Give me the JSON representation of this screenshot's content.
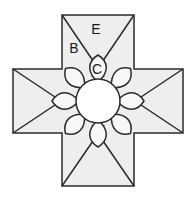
{
  "figure": {
    "name": "cross-rosette-diagram",
    "colors": {
      "arm_fill": "#eeeeee",
      "center_fill": "#ffffff",
      "petal_fill": "#f7f7f7",
      "stroke": "#2b2b2b",
      "background": "#ffffff",
      "label": "#1a1a1a"
    },
    "geometry": {
      "cross_left": 13,
      "cross_right": 183,
      "cross_top": 15,
      "cross_bottom": 186,
      "arm_inner_left": 62,
      "arm_inner_right": 134,
      "arm_inner_top": 69,
      "arm_inner_bottom": 133,
      "center_x": 98,
      "center_y": 101,
      "center_radius": 22,
      "petal_count": 8,
      "petal_inner_radius": 22,
      "petal_outer_radius": 46,
      "petal_half_width": 11,
      "stroke_width": 1.5
    }
  },
  "labels": [
    {
      "id": "label-b",
      "text": "B",
      "x": 74,
      "y": 49
    },
    {
      "id": "label-e",
      "text": "E",
      "x": 96,
      "y": 30
    },
    {
      "id": "label-c",
      "text": "C",
      "x": 97,
      "y": 70
    }
  ]
}
